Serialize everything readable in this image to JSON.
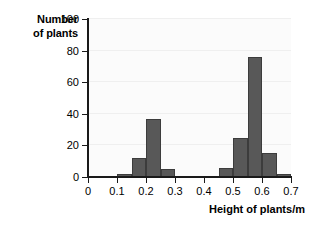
{
  "chart_data": {
    "type": "bar",
    "title": "",
    "subtitle": "",
    "xlabel": "Height of plants/m",
    "ylabel_lines": [
      "Number",
      "of plants"
    ],
    "ylabel": "Number of plants",
    "grid": true,
    "legend": "none",
    "bin_width": 0.05,
    "xlim": [
      0,
      0.7
    ],
    "ylim": [
      0,
      100
    ],
    "x_ticks": [
      "0",
      "0.1",
      "0.2",
      "0.3",
      "0.4",
      "0.5",
      "0.6",
      "0.7"
    ],
    "x_tick_values": [
      0,
      0.1,
      0.2,
      0.3,
      0.4,
      0.5,
      0.6,
      0.7
    ],
    "y_ticks": [
      "0",
      "20",
      "40",
      "60",
      "80",
      "100"
    ],
    "y_tick_values": [
      0,
      20,
      40,
      60,
      80,
      100
    ],
    "bars": [
      {
        "bin_start": 0.1,
        "bin_end": 0.15,
        "value": 2
      },
      {
        "bin_start": 0.15,
        "bin_end": 0.2,
        "value": 12
      },
      {
        "bin_start": 0.2,
        "bin_end": 0.25,
        "value": 37
      },
      {
        "bin_start": 0.25,
        "bin_end": 0.3,
        "value": 5
      },
      {
        "bin_start": 0.45,
        "bin_end": 0.5,
        "value": 6
      },
      {
        "bin_start": 0.5,
        "bin_end": 0.55,
        "value": 25
      },
      {
        "bin_start": 0.55,
        "bin_end": 0.6,
        "value": 76
      },
      {
        "bin_start": 0.6,
        "bin_end": 0.65,
        "value": 15
      },
      {
        "bin_start": 0.65,
        "bin_end": 0.7,
        "value": 2
      }
    ],
    "categories": [
      "0.10-0.15",
      "0.15-0.20",
      "0.20-0.25",
      "0.25-0.30",
      "0.45-0.50",
      "0.50-0.55",
      "0.55-0.60",
      "0.60-0.65",
      "0.65-0.70"
    ],
    "values": [
      2,
      12,
      37,
      5,
      6,
      25,
      76,
      15,
      2
    ],
    "colors": {
      "bar_fill": "#585858",
      "bar_edge": "#3c3c3c",
      "axis": "#1a1a1a",
      "gridline": "#efefef",
      "plot_background": "#fbfbfb",
      "page_background": "#ffffff",
      "text": "#000000"
    }
  }
}
